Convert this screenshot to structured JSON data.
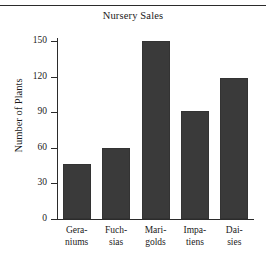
{
  "chart_data": {
    "type": "bar",
    "title": "Nursery Sales",
    "xlabel": "",
    "ylabel": "Number of Plants",
    "categories": [
      "Geraniums",
      "Fuchsias",
      "Marigolds",
      "Impatiens",
      "Daisies"
    ],
    "category_lines": [
      [
        "Gera-",
        "niums"
      ],
      [
        "Fuch-",
        "sias"
      ],
      [
        "Mari-",
        "golds"
      ],
      [
        "Impa-",
        "tiens"
      ],
      [
        "Dai-",
        "sies"
      ]
    ],
    "values": [
      46,
      60,
      150,
      91,
      119
    ],
    "ylim": [
      0,
      150
    ],
    "yticks": [
      0,
      30,
      60,
      90,
      120,
      150
    ],
    "ytick_labels": [
      "0",
      "30",
      "60",
      "90",
      "120",
      "150"
    ],
    "grid": false,
    "legend": false,
    "bar_color": "#3a3a3a",
    "axis_color": "#2b2b2b",
    "background": "#ffffff"
  }
}
